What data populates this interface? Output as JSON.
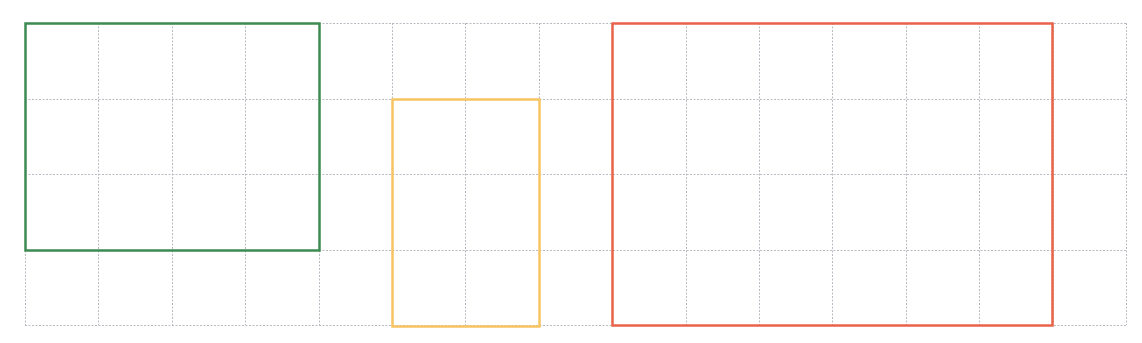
{
  "diagram": {
    "type": "grid-with-rectangles",
    "grid": {
      "origin_x": 25,
      "origin_y": 23,
      "cell_width": 73.4,
      "cell_height": 75.5,
      "columns": 15,
      "rows": 4,
      "line_color": "#b8bcc2",
      "line_style": "dashed"
    },
    "rectangles": [
      {
        "name": "green-rectangle",
        "color": "#3d8a52",
        "col": 0,
        "row": 0,
        "cols": 4,
        "rows": 3
      },
      {
        "name": "yellow-rectangle",
        "color": "#f7c462",
        "col": 5,
        "row": 1,
        "cols": 2,
        "rows": 3
      },
      {
        "name": "red-rectangle",
        "color": "#e8634a",
        "col": 8,
        "row": 0,
        "cols": 6,
        "rows": 4
      }
    ]
  }
}
